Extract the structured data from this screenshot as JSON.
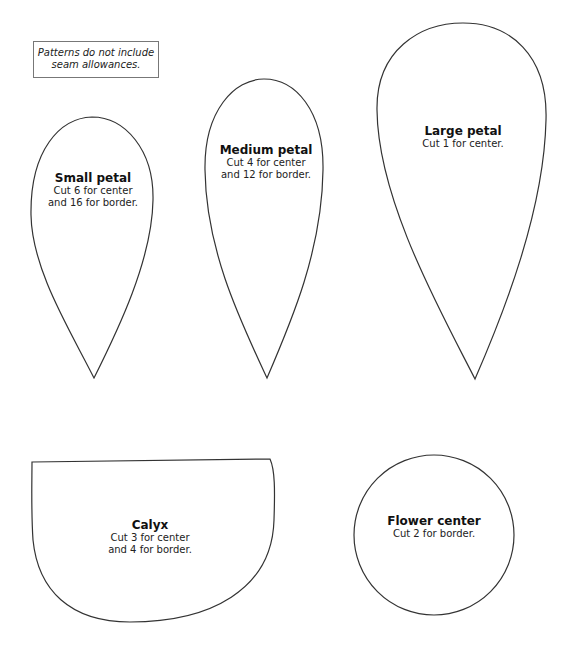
{
  "note": {
    "line1": "Patterns do not include",
    "line2": "seam allowances."
  },
  "pieces": {
    "small_petal": {
      "title": "Small petal",
      "line1": "Cut 6 for center",
      "line2": "and 16 for border."
    },
    "medium_petal": {
      "title": "Medium petal",
      "line1": "Cut 4 for center",
      "line2": "and 12 for border."
    },
    "large_petal": {
      "title": "Large petal",
      "line1": "Cut 1 for center.",
      "line2": ""
    },
    "calyx": {
      "title": "Calyx",
      "line1": "Cut 3 for center",
      "line2": "and 4 for border."
    },
    "flower_center": {
      "title": "Flower center",
      "line1": "Cut 2 for border.",
      "line2": ""
    }
  },
  "colors": {
    "outline": "#333333",
    "background": "#ffffff"
  }
}
